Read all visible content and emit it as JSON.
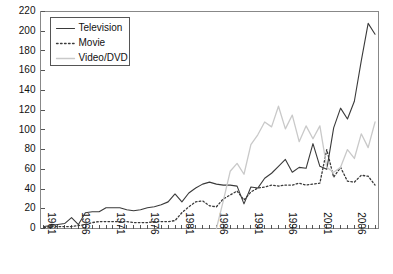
{
  "chart_data": {
    "type": "line",
    "title": "",
    "subtitle": "",
    "xlabel": "",
    "ylabel": "",
    "xlim": [
      1961,
      2009
    ],
    "ylim": [
      0,
      220
    ],
    "y_ticks": [
      0,
      20,
      40,
      60,
      80,
      100,
      120,
      140,
      160,
      180,
      200,
      220
    ],
    "x_tick_labels": [
      "1961",
      "1966",
      "1971",
      "1976",
      "1981",
      "1986",
      "1991",
      "1996",
      "2001",
      "2006"
    ],
    "x_tick_years": [
      1961,
      1966,
      1971,
      1976,
      1981,
      1986,
      1991,
      1996,
      2001,
      2006
    ],
    "x_tick_rotation": 90,
    "grid": false,
    "legend_position": "top-left",
    "x": [
      1961,
      1962,
      1963,
      1964,
      1965,
      1966,
      1967,
      1968,
      1969,
      1970,
      1971,
      1972,
      1973,
      1974,
      1975,
      1976,
      1977,
      1978,
      1979,
      1980,
      1981,
      1982,
      1983,
      1984,
      1985,
      1986,
      1987,
      1988,
      1989,
      1990,
      1991,
      1992,
      1993,
      1994,
      1995,
      1996,
      1997,
      1998,
      1999,
      2000,
      2001,
      2002,
      2003,
      2004,
      2005,
      2006,
      2007,
      2008,
      2009
    ],
    "series": [
      {
        "name": "Television",
        "style": "solid",
        "color": "#3a3a3a",
        "width": 1.1,
        "values": [
          2,
          3,
          4,
          5,
          11,
          4,
          16,
          17,
          17,
          21,
          21,
          21,
          19,
          18,
          19,
          21,
          22,
          24,
          27,
          35,
          27,
          36,
          41,
          45,
          47,
          45,
          44,
          44,
          43,
          25,
          42,
          41,
          51,
          56,
          63,
          70,
          57,
          62,
          61,
          86,
          63,
          60,
          102,
          122,
          111,
          129,
          170,
          208,
          197
        ]
      },
      {
        "name": "Movie",
        "style": "dotted",
        "color": "#3a3a3a",
        "width": 1.3,
        "values": [
          1,
          2,
          2,
          2,
          2,
          3,
          4,
          6,
          7,
          7,
          7,
          7,
          7,
          6,
          6,
          6,
          7,
          7,
          7,
          8,
          16,
          22,
          27,
          28,
          23,
          22,
          30,
          34,
          38,
          29,
          37,
          41,
          42,
          44,
          43,
          44,
          44,
          46,
          44,
          45,
          46,
          80,
          52,
          62,
          48,
          47,
          54,
          53,
          44
        ]
      },
      {
        "name": "Video/DVD",
        "style": "solid",
        "color": "#c9c9c9",
        "width": 1.3,
        "values": [
          null,
          null,
          null,
          null,
          null,
          null,
          null,
          null,
          null,
          null,
          null,
          null,
          null,
          null,
          null,
          null,
          null,
          null,
          null,
          null,
          null,
          null,
          null,
          null,
          null,
          0,
          28,
          58,
          66,
          55,
          85,
          95,
          108,
          103,
          124,
          101,
          115,
          88,
          104,
          91,
          104,
          62,
          57,
          62,
          80,
          71,
          96,
          82,
          108
        ]
      }
    ]
  },
  "legend": {
    "entries": [
      {
        "label": "Television"
      },
      {
        "label": "Movie"
      },
      {
        "label": "Video/DVD"
      }
    ]
  },
  "colors": {
    "television": "#3a3a3a",
    "movie": "#3a3a3a",
    "video_dvd": "#c9c9c9",
    "axis": "#555555",
    "background": "#ffffff"
  }
}
